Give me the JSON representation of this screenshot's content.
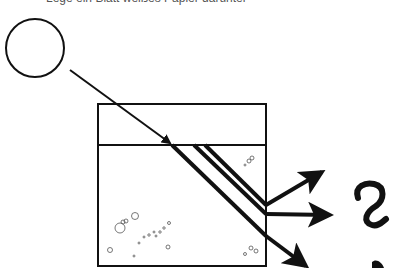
{
  "caption": "Lege ein Blatt weißes Papier darunter",
  "diagram": {
    "type": "light refraction through water tank",
    "elements": {
      "light_source": "circle (lamp)",
      "tank": "rectangular container with water line",
      "incoming_ray": "single arrow from light source to water surface",
      "refracted_rays": "three parallel thick rays inside water",
      "exiting_rays": "three arrows leaving tank on right side",
      "question_mark": "?"
    },
    "colors": {
      "stroke": "#111111",
      "background": "#ffffff"
    }
  }
}
